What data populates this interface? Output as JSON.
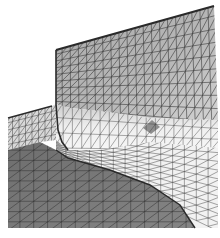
{
  "figure": {
    "width": 220,
    "height": 238,
    "colors": {
      "background": "#ffffff",
      "wall": "#b4b4b4",
      "wall_highlight": "#cfcfcf",
      "fillet_light": "#e6e6e6",
      "floor": "#f2f2f2",
      "dark_region": "#7a7a7a",
      "ledge": "#d8d8d8",
      "mesh_line": "#3a3a3a",
      "edge_dark": "#2a2a2a",
      "shadow_patch": "#8e8e8e"
    },
    "regions": {
      "wall": [
        [
          56,
          50
        ],
        [
          214,
          6
        ],
        [
          218,
          120
        ],
        [
          150,
          118
        ],
        [
          110,
          112
        ],
        [
          70,
          108
        ],
        [
          56,
          104
        ]
      ],
      "fillet": [
        [
          56,
          104
        ],
        [
          70,
          108
        ],
        [
          110,
          112
        ],
        [
          150,
          118
        ],
        [
          218,
          120
        ],
        [
          218,
          148
        ],
        [
          150,
          142
        ],
        [
          100,
          150
        ],
        [
          68,
          150
        ],
        [
          56,
          140
        ]
      ],
      "floor": [
        [
          56,
          140
        ],
        [
          68,
          150
        ],
        [
          100,
          150
        ],
        [
          150,
          142
        ],
        [
          218,
          148
        ],
        [
          218,
          228
        ],
        [
          195,
          228
        ],
        [
          180,
          205
        ],
        [
          150,
          185
        ],
        [
          110,
          170
        ],
        [
          68,
          158
        ],
        [
          56,
          150
        ]
      ],
      "ledge": [
        [
          8,
          118
        ],
        [
          52,
          106
        ],
        [
          56,
          104
        ],
        [
          56,
          140
        ],
        [
          40,
          142
        ],
        [
          8,
          150
        ]
      ],
      "dark_region": [
        [
          8,
          150
        ],
        [
          40,
          142
        ],
        [
          56,
          150
        ],
        [
          68,
          158
        ],
        [
          110,
          170
        ],
        [
          150,
          185
        ],
        [
          180,
          205
        ],
        [
          195,
          228
        ],
        [
          8,
          228
        ]
      ],
      "shadow_patch": [
        [
          143,
          128
        ],
        [
          152,
          120
        ],
        [
          160,
          127
        ],
        [
          151,
          134
        ]
      ]
    },
    "mesh": {
      "wall_rows": 9,
      "wall_cols": 20,
      "floor_rows": 10,
      "floor_cols": 14,
      "dark_rows": 9,
      "dark_cols": 14,
      "ledge_rows": 5,
      "ledge_cols": 8
    }
  }
}
